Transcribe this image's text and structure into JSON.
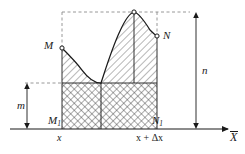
{
  "figure": {
    "type": "geometric-diagram",
    "canvas": {
      "width": 245,
      "height": 154
    },
    "colors": {
      "stroke": "#1a1a1a",
      "dashed": "#8c8c8c",
      "hatch": "#555555",
      "crosshatch": "#444444",
      "background": "#ffffff"
    }
  },
  "labels": {
    "point_M": "M",
    "point_N": "N",
    "point_M1_base": "M",
    "point_M1_sub": "1",
    "point_N1_base": "N",
    "point_N1_sub": "1",
    "height_m": "m",
    "height_n": "n",
    "tick_x": "x",
    "tick_x_plus_dx": "x + Δx",
    "axis_x": "X"
  },
  "geometry": {
    "axis": {
      "y": 129,
      "x_start": 10,
      "x_end": 232
    },
    "left_ordinate_x": 62,
    "right_ordinate_x": 157,
    "base_y": 129,
    "m_top_y": 83,
    "peak_top_y": 12,
    "point_M": {
      "x": 62,
      "y": 48
    },
    "point_N": {
      "x": 157,
      "y": 36
    },
    "peak": {
      "x": 134,
      "y": 12
    },
    "cusp": {
      "x": 101,
      "y": 83
    },
    "m_arrow_x": 27,
    "n_arrow_x": 196
  }
}
